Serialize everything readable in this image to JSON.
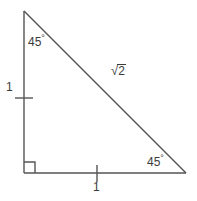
{
  "figure": {
    "type": "right-isosceles-triangle",
    "stroke_color": "#555555",
    "text_color": "#3b3b3b",
    "background_color": "#ffffff"
  },
  "labels": {
    "angle_top": "45",
    "angle_top_unit": "°",
    "angle_bottom_right": "45",
    "angle_bottom_right_unit": "°",
    "leg_vertical": "1",
    "leg_horizontal": "1",
    "hypotenuse_radical": "√",
    "hypotenuse_radicand": "2"
  },
  "markers": {
    "right_angle": "right-angle-square",
    "tick_vertical_leg": "congruence-tick",
    "tick_horizontal_leg": "congruence-tick"
  },
  "geometry": {
    "vertex_top": [
      24,
      11
    ],
    "vertex_bottom_left": [
      24,
      173
    ],
    "vertex_bottom_right": [
      186,
      173
    ]
  }
}
